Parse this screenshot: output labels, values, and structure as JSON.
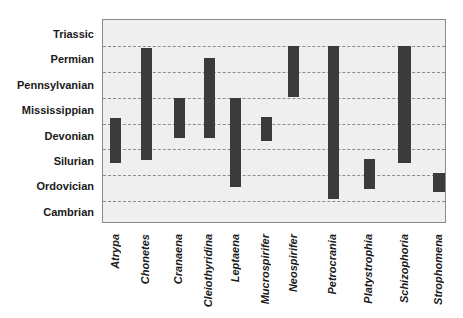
{
  "chart_data": {
    "type": "bar",
    "subtype": "floating-range",
    "title": "",
    "xlabel": "",
    "ylabel": "",
    "periods_bottom_to_top": [
      "Cambrian",
      "Ordovician",
      "Silurian",
      "Devonian",
      "Mississippian",
      "Pennsylvanian",
      "Permian",
      "Triassic"
    ],
    "y_tick_labels": [
      "Triassic",
      "Permian",
      "Pennsylvanian",
      "Mississippian",
      "Devonian",
      "Silurian",
      "Ordovician",
      "Cambrian"
    ],
    "grid": "dashed horizontal lines between periods",
    "legend": null,
    "categories": [
      "Atrypa",
      "Chonetes",
      "Cranaena",
      "Cleiothyridina",
      "Leptaena",
      "Mucrospirifer",
      "Neospirifer",
      "Petrocrania",
      "Platystrophia",
      "Schizophoria",
      "Strophomena"
    ],
    "ranges": [
      {
        "genus": "Atrypa",
        "from": "Silurian",
        "to": "Devonian"
      },
      {
        "genus": "Chonetes",
        "from": "Silurian",
        "to": "Permian"
      },
      {
        "genus": "Cranaena",
        "from": "Devonian",
        "to": "Mississippian"
      },
      {
        "genus": "Cleiothyridina",
        "from": "Devonian",
        "to": "Permian"
      },
      {
        "genus": "Leptaena",
        "from": "Ordovician",
        "to": "Mississippian"
      },
      {
        "genus": "Mucrospirifer",
        "from": "Devonian",
        "to": "Devonian"
      },
      {
        "genus": "Neospirifer",
        "from": "Pennsylvanian",
        "to": "Permian"
      },
      {
        "genus": "Petrocrania",
        "from": "Ordovician",
        "to": "Permian"
      },
      {
        "genus": "Platystrophia",
        "from": "Ordovician",
        "to": "Silurian"
      },
      {
        "genus": "Schizophoria",
        "from": "Silurian",
        "to": "Permian"
      },
      {
        "genus": "Strophomena",
        "from": "Ordovician",
        "to": "Ordovician"
      }
    ],
    "bar_color": "#3b3b3b",
    "background_color": "#efefef"
  },
  "layout": {
    "y_labels": [
      {
        "text": "Triassic",
        "y": 34
      },
      {
        "text": "Permian",
        "y": 59
      },
      {
        "text": "Pennsylvanian",
        "y": 85
      },
      {
        "text": "Mississippian",
        "y": 110
      },
      {
        "text": "Devonian",
        "y": 136
      },
      {
        "text": "Silurian",
        "y": 161
      },
      {
        "text": "Ordovician",
        "y": 186
      },
      {
        "text": "Cambrian",
        "y": 212
      }
    ],
    "gridlines_y": [
      26,
      52,
      78,
      104,
      129,
      155,
      181
    ],
    "bars": [
      {
        "label": "Atrypa",
        "x": 7,
        "w": 11,
        "top": 98,
        "bottom": 143,
        "cx": 115
      },
      {
        "label": "Chonetes",
        "x": 38,
        "w": 11,
        "top": 28,
        "bottom": 140,
        "cx": 145
      },
      {
        "label": "Cranaena",
        "x": 71,
        "w": 11,
        "top": 78,
        "bottom": 118,
        "cx": 178
      },
      {
        "label": "Cleiothyridina",
        "x": 101,
        "w": 11,
        "top": 38,
        "bottom": 118,
        "cx": 208
      },
      {
        "label": "Leptaena",
        "x": 127,
        "w": 11,
        "top": 78,
        "bottom": 167,
        "cx": 235
      },
      {
        "label": "Mucrospirifer",
        "x": 158,
        "w": 11,
        "top": 97,
        "bottom": 121,
        "cx": 265
      },
      {
        "label": "Neospirifer",
        "x": 185,
        "w": 11,
        "top": 26,
        "bottom": 77,
        "cx": 293
      },
      {
        "label": "Petrocrania",
        "x": 225,
        "w": 11,
        "top": 26,
        "bottom": 179,
        "cx": 332
      },
      {
        "label": "Platystrophia",
        "x": 261,
        "w": 11,
        "top": 139,
        "bottom": 169,
        "cx": 368
      },
      {
        "label": "Schizophoria",
        "x": 295,
        "w": 13,
        "top": 26,
        "bottom": 143,
        "cx": 404
      },
      {
        "label": "Strophomena",
        "x": 330,
        "w": 12,
        "top": 153,
        "bottom": 172,
        "cx": 438
      }
    ]
  }
}
